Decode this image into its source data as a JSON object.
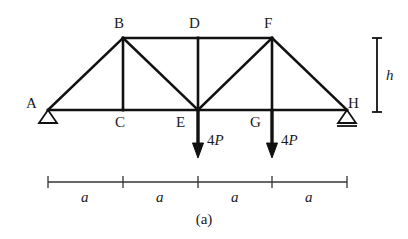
{
  "figure": {
    "caption": "(a)",
    "type": "truss-free-body-diagram",
    "line_color": "#111111",
    "background_color": "#ffffff",
    "dimension_line_color": "#333333"
  },
  "nodes": [
    {
      "id": "A",
      "label": "A",
      "x": 48,
      "y": 110,
      "label_x": 26,
      "label_y": 96,
      "support": "pin"
    },
    {
      "id": "B",
      "label": "B",
      "x": 123,
      "y": 38,
      "label_x": 114,
      "label_y": 16,
      "support": "none"
    },
    {
      "id": "C",
      "label": "C",
      "x": 123,
      "y": 110,
      "label_x": 115,
      "label_y": 115,
      "support": "none"
    },
    {
      "id": "D",
      "label": "D",
      "x": 198,
      "y": 38,
      "label_x": 189,
      "label_y": 16,
      "support": "none"
    },
    {
      "id": "E",
      "label": "E",
      "x": 198,
      "y": 110,
      "label_x": 176,
      "label_y": 115,
      "support": "none"
    },
    {
      "id": "F",
      "label": "F",
      "x": 272,
      "y": 38,
      "label_x": 264,
      "label_y": 16,
      "support": "none"
    },
    {
      "id": "G",
      "label": "G",
      "x": 272,
      "y": 110,
      "label_x": 250,
      "label_y": 115,
      "support": "none"
    },
    {
      "id": "H",
      "label": "H",
      "x": 347,
      "y": 110,
      "label_x": 348,
      "label_y": 96,
      "support": "roller"
    }
  ],
  "members": [
    {
      "from": "A",
      "to": "C",
      "kind": "bottom-chord"
    },
    {
      "from": "C",
      "to": "E",
      "kind": "bottom-chord"
    },
    {
      "from": "E",
      "to": "G",
      "kind": "bottom-chord"
    },
    {
      "from": "G",
      "to": "H",
      "kind": "bottom-chord"
    },
    {
      "from": "B",
      "to": "D",
      "kind": "top-chord"
    },
    {
      "from": "D",
      "to": "F",
      "kind": "top-chord"
    },
    {
      "from": "A",
      "to": "B",
      "kind": "diagonal"
    },
    {
      "from": "B",
      "to": "E",
      "kind": "diagonal"
    },
    {
      "from": "E",
      "to": "F",
      "kind": "diagonal"
    },
    {
      "from": "F",
      "to": "H",
      "kind": "diagonal"
    },
    {
      "from": "B",
      "to": "C",
      "kind": "vertical"
    },
    {
      "from": "D",
      "to": "E",
      "kind": "vertical"
    },
    {
      "from": "F",
      "to": "G",
      "kind": "vertical"
    }
  ],
  "loads": [
    {
      "at_node": "E",
      "magnitude": "4",
      "symbol": "P",
      "label": "4P",
      "direction": "down",
      "x": 198,
      "y_start": 110,
      "y_end": 158,
      "label_x": 207,
      "label_y": 133
    },
    {
      "at_node": "G",
      "magnitude": "4",
      "symbol": "P",
      "label": "4P",
      "direction": "down",
      "x": 272,
      "y_start": 110,
      "y_end": 158,
      "label_x": 281,
      "label_y": 133
    }
  ],
  "height_dimension": {
    "label": "h",
    "x": 377,
    "y_top": 38,
    "y_bottom": 112,
    "label_x": 386,
    "label_y": 68
  },
  "span_dimension": {
    "y": 182,
    "ticks": [
      48,
      123,
      198,
      272,
      347
    ],
    "spans": [
      {
        "label": "a",
        "center_x": 85,
        "label_y": 190
      },
      {
        "label": "a",
        "center_x": 160,
        "label_y": 190
      },
      {
        "label": "a",
        "center_x": 235,
        "label_y": 190
      },
      {
        "label": "a",
        "center_x": 309,
        "label_y": 190
      }
    ]
  }
}
